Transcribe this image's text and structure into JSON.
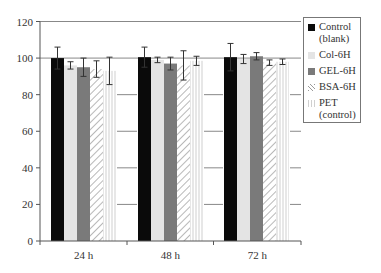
{
  "chart_data": {
    "type": "bar",
    "title": "",
    "xlabel": "",
    "ylabel": "",
    "ylim": [
      0,
      120
    ],
    "yticks": [
      0,
      20,
      40,
      60,
      80,
      100,
      120
    ],
    "grid": "horizontal gridlines visible only between groups; top line at 120",
    "legend_position": "right",
    "categories": [
      "24 h",
      "48 h",
      "72 h"
    ],
    "series": [
      {
        "name": "Control (blank)",
        "label_lines": "Control\n(blank)",
        "pattern": "solid-black",
        "color": "#0a0a0a",
        "values": [
          100,
          100.5,
          100.5
        ],
        "errors": [
          6,
          5.5,
          7.5
        ]
      },
      {
        "name": "Col-6H",
        "label_lines": "Col-6H",
        "pattern": "solid-lightgray",
        "color": "#e4e4e4",
        "values": [
          96,
          99,
          99.5
        ],
        "errors": [
          2,
          1.5,
          2.5
        ]
      },
      {
        "name": "GEL-6H",
        "label_lines": "GEL-6H",
        "pattern": "solid-darkgray",
        "color": "#7a7a7a",
        "values": [
          95,
          97,
          101
        ],
        "errors": [
          5,
          3.5,
          2
        ]
      },
      {
        "name": "BSA-6H",
        "label_lines": "BSA-6H",
        "pattern": "diagonal-hatch",
        "color": "#9a9a9a",
        "values": [
          94,
          96,
          97.5
        ],
        "errors": [
          4.5,
          8,
          1.5
        ]
      },
      {
        "name": "PET (control)",
        "label_lines": "PET\n(control)",
        "pattern": "vertical-lines",
        "color": "#d0d0d0",
        "values": [
          93,
          98.5,
          98
        ],
        "errors": [
          7.5,
          2.5,
          1.5
        ]
      }
    ]
  }
}
